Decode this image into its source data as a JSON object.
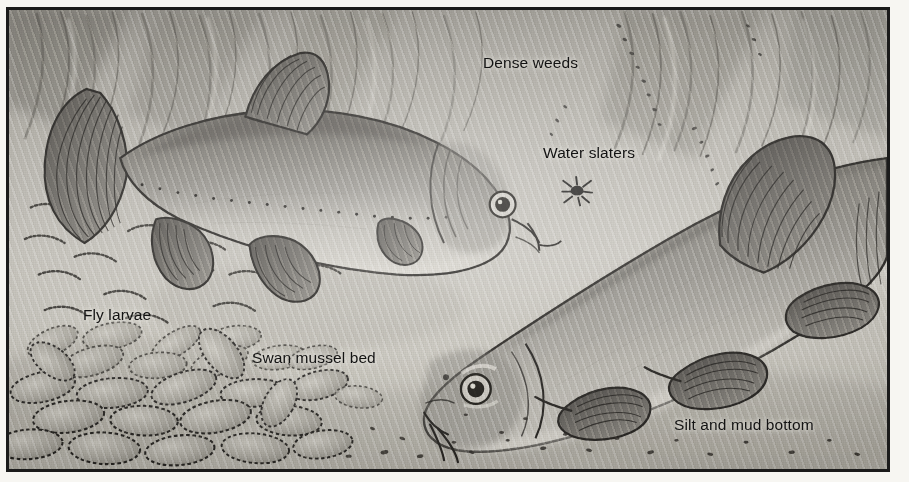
{
  "illustration": {
    "title": "Tench in weedy lake margin",
    "medium": "pen-and-ink and wash, reproduced in halftone greyscale",
    "frame": {
      "style": "single dark rule",
      "color": "#1b1b1b"
    },
    "palette": {
      "paper": "#f7f6f2",
      "water_light": "#cfccc4",
      "water_mid": "#b5b2aa",
      "water_dark": "#8e8b84",
      "ink": "#1b1b1b",
      "fish_body": "#8d8a82",
      "fish_shadow": "#55524c"
    }
  },
  "labels": [
    {
      "id": "dense-weeds",
      "text": "Dense weeds",
      "x": 474,
      "y": 44
    },
    {
      "id": "water-slaters",
      "text": "Water slaters",
      "x": 534,
      "y": 134
    },
    {
      "id": "fly-larvae",
      "text": "Fly larvae",
      "x": 74,
      "y": 296
    },
    {
      "id": "swan-mussel",
      "text": "Swan mussel bed",
      "x": 243,
      "y": 339
    },
    {
      "id": "silt-mud",
      "text": "Silt and mud bottom",
      "x": 665,
      "y": 406
    }
  ],
  "subjects": [
    {
      "id": "tench-upper",
      "common_name": "Tench",
      "orientation": "facing right, upper left of plate",
      "features": [
        "rounded caudal fin",
        "dotted lateral line",
        "single barbel at mouth corner",
        "rounded dorsal fin",
        "paired pelvic and pectoral fins",
        "small round eye"
      ]
    },
    {
      "id": "tench-lower",
      "common_name": "Tench",
      "orientation": "facing left and down, lower right of plate",
      "features": [
        "large rounded dorsal fin",
        "heavy body",
        "prominent eye",
        "paired barbels",
        "deep paddle-like pelvic fins"
      ]
    }
  ],
  "habitat_elements": [
    {
      "id": "weed-strands",
      "description": "diagonal strands of dense pondweed across upper background"
    },
    {
      "id": "water-slater",
      "description": "single dark water slater (Asellus) drawn mid-water"
    },
    {
      "id": "fly-larvae-cluster",
      "description": "scattered curved worm-like fly larvae on left substrate"
    },
    {
      "id": "mussel-bed",
      "description": "dense bed of oval swan mussel shells across lower left"
    },
    {
      "id": "silt-specks",
      "description": "fine dark specks of silt and detritus over the bottom"
    }
  ]
}
